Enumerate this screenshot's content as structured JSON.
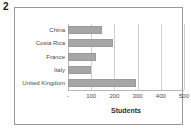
{
  "figure": {
    "number": "2"
  },
  "chart_data": {
    "type": "bar",
    "orientation": "horizontal",
    "title": "",
    "xlabel": "Students",
    "ylabel": "",
    "categories": [
      "China",
      "Costa Rica",
      "France",
      "Italy",
      "United Kingdom"
    ],
    "values": [
      145,
      195,
      122,
      98,
      295
    ],
    "series": [
      {
        "name": "Students",
        "values": [
          145,
          195,
          122,
          98,
          295
        ]
      }
    ],
    "xlim": [
      0,
      500
    ],
    "xticks": [
      0,
      100,
      200,
      300,
      400,
      500
    ],
    "xticklabels": [
      "-",
      "100",
      "200",
      "300",
      "400",
      "500"
    ],
    "grid": "vertical",
    "legend": "none",
    "bar_color": "#a6a6a6",
    "gridline_color": "#d2d2d2",
    "frame_color": "#9a9a9a"
  }
}
